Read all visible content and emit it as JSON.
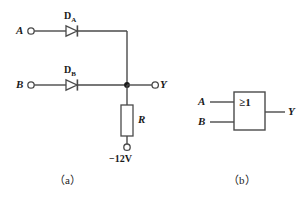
{
  "figure": {
    "background_color": "#ffffff",
    "line_color": "#4a4a4a",
    "text_color": "#1a1a1a"
  },
  "circuit_a": {
    "caption": "（a）",
    "inputs": [
      {
        "label": "A",
        "terminal": "open-circle",
        "row": "top"
      },
      {
        "label": "B",
        "terminal": "open-circle",
        "row": "bottom"
      }
    ],
    "diodes": [
      {
        "name": "D",
        "subscript": "A",
        "orientation": "anode-left-cathode-right"
      },
      {
        "name": "D",
        "subscript": "B",
        "orientation": "anode-left-cathode-right"
      }
    ],
    "output": {
      "label": "Y",
      "terminal": "open-circle"
    },
    "resistor": {
      "label": "R"
    },
    "supply": {
      "label": "−12V",
      "terminal": "open-circle"
    },
    "junction": {
      "name": "node-dot",
      "type": "solid-dot"
    }
  },
  "symbol_b": {
    "caption": "（b）",
    "gate_symbol": "≥1",
    "gate_type": "OR",
    "inputs": [
      {
        "label": "A"
      },
      {
        "label": "B"
      }
    ],
    "output": {
      "label": "Y"
    }
  }
}
